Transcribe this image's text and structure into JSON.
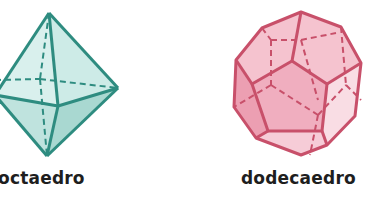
{
  "figures": [
    {
      "name": "octaedro",
      "label": "octaedro",
      "color": {
        "stroke": "#2e8c80",
        "fill_light": "#d6efec",
        "fill_mid": "#bfe4df",
        "fill_dark": "#a7d7d0"
      }
    },
    {
      "name": "dodecaedro",
      "label": "dodecaedro",
      "color": {
        "stroke": "#c8506a",
        "fill_light": "#f7d3dc",
        "fill_mid": "#f2b9c6",
        "fill_dark": "#ec9fb1"
      }
    }
  ]
}
